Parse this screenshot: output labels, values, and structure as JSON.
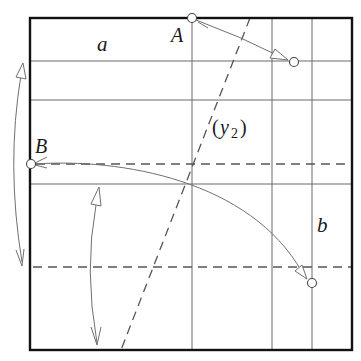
{
  "diagram": {
    "type": "folding-diagram",
    "colors": {
      "border": "#111111",
      "grid_line": "#555555",
      "dashed_line": "#555555",
      "arrow": "#666666",
      "point_fill": "#ffffff",
      "text": "#1a1a1a"
    },
    "frame": {
      "x1": 30,
      "y1": 18,
      "x2": 352,
      "y2": 350
    },
    "grid": {
      "horizontal_solid_y": [
        61,
        100,
        184
      ],
      "vertical_solid_x": [
        192,
        272,
        312
      ],
      "horizontal_dashed_y": [
        164,
        267
      ],
      "diagonal_dashed": {
        "x1": 250,
        "y1": 18,
        "x2": 121,
        "y2": 350
      }
    },
    "points": [
      {
        "id": "A",
        "x": 192,
        "y": 18
      },
      {
        "id": "A_target",
        "x": 294,
        "y": 62
      },
      {
        "id": "B",
        "x": 31,
        "y": 164
      },
      {
        "id": "B_target",
        "x": 312,
        "y": 283
      }
    ],
    "labels": {
      "a": "a",
      "b": "b",
      "A": "A",
      "B": "B",
      "y2_open": "(",
      "y2_var": "y",
      "y2_sub": "2",
      "y2_close": ")"
    },
    "arrows": [
      {
        "name": "fold-A-arrow",
        "from": "A",
        "to": "A_target",
        "style": "single-open-head"
      },
      {
        "name": "fold-B-arrow",
        "from": "B",
        "to": "B_target",
        "style": "single-open-head-curved"
      },
      {
        "name": "left-swing-arrow",
        "from": [
          20,
          62
        ],
        "to": [
          22,
          265
        ],
        "style": "double-curved"
      },
      {
        "name": "middle-swing-arrow",
        "from": [
          98,
          186
        ],
        "to": [
          98,
          345
        ],
        "style": "double-curved"
      }
    ]
  }
}
